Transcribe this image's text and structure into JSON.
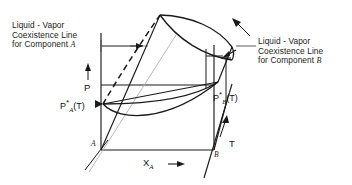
{
  "figure": {
    "kind": "3d-phase-diagram",
    "title": "",
    "stroke_color": "#1a1a1a",
    "dashed_color": "#1a1a1a",
    "faint_color": "#a8a8a8",
    "background": "#ffffff"
  },
  "annotations": {
    "left_caption": {
      "line1": "Liquid - Vapor",
      "line2": "Coexistence Line",
      "line3_prefix": "for Component ",
      "line3_component": "ℬ",
      "component_symbol": "A"
    },
    "right_caption": {
      "line1": "Liquid - Vapor",
      "line2": "Coexistence Line",
      "line3_prefix": "for Component ",
      "line3_component": "ℬ",
      "component_symbol": "B"
    }
  },
  "axes": {
    "pressure": {
      "label": "P",
      "arrow": "up"
    },
    "temperature": {
      "label": "T",
      "arrow": "up-right"
    },
    "composition": {
      "label_prefix": "X",
      "label_subscript": "A",
      "arrow": "right"
    }
  },
  "points": {
    "p_star_a": {
      "base": "P",
      "superscript": "*",
      "subscript": "A",
      "argument": "(T)"
    },
    "p_star_b": {
      "base": "P",
      "superscript": "*",
      "subscript": "B",
      "argument": "(T)"
    }
  },
  "corners": {
    "front_left_component": "A",
    "front_right_component": "B"
  }
}
